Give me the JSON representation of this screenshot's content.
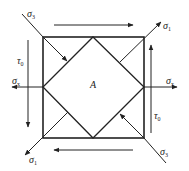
{
  "diagram": {
    "center_label": "A",
    "labels": {
      "sigma3_top_left": {
        "main": "σ",
        "sub": "3"
      },
      "sigma1_top_right": {
        "main": "σ",
        "sub": "1"
      },
      "sigma1_bottom_left": {
        "main": "σ",
        "sub": "1"
      },
      "sigma3_bottom_right": {
        "main": "σ",
        "sub": "3"
      },
      "sigmax_left": {
        "main": "σ",
        "sub": "x"
      },
      "sigmax_right": {
        "main": "σ",
        "sub": "x"
      },
      "tau0_left": {
        "main": "τ",
        "sub": "0"
      },
      "tau0_right": {
        "main": "τ",
        "sub": "0"
      }
    },
    "arrows": {
      "top_shear": "right",
      "bottom_shear": "left",
      "left_shear": "down",
      "right_shear": "up",
      "left_normal": "left",
      "right_normal": "right",
      "sigma1": "outward",
      "sigma3": "inward"
    },
    "colors": {
      "stroke": "#222222",
      "background": "#ffffff"
    }
  }
}
